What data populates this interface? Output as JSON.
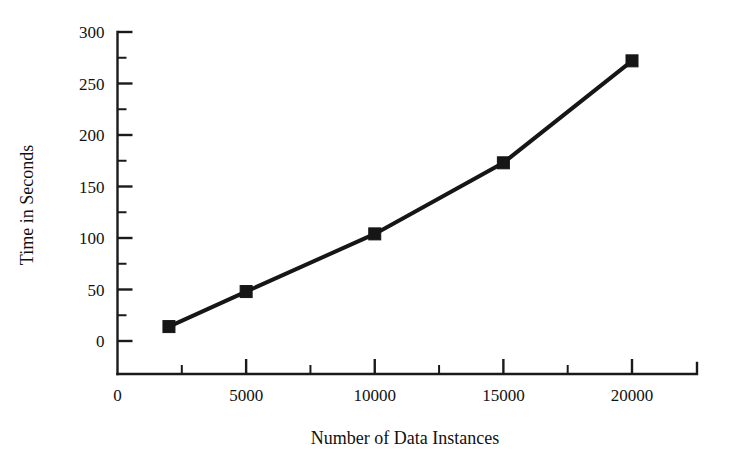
{
  "chart_data": {
    "type": "line",
    "title": "",
    "subtitle": "",
    "xlabel": "Number of Data Instances",
    "ylabel": "Time in Seconds",
    "x": [
      2000,
      5000,
      10000,
      15000,
      20000
    ],
    "values": [
      14,
      48,
      104,
      173,
      272
    ],
    "series": [
      {
        "name": "Runtime",
        "x": [
          2000,
          5000,
          10000,
          15000,
          20000
        ],
        "values": [
          14,
          48,
          104,
          173,
          272
        ]
      }
    ],
    "xlim": [
      0,
      22500
    ],
    "ylim": [
      0,
      300
    ],
    "xticks": [
      0,
      5000,
      10000,
      15000,
      20000
    ],
    "xticklabels": [
      "0",
      "5000",
      "10000",
      "15000",
      "20000"
    ],
    "xminorticks": [
      2500,
      7500,
      12500,
      17500,
      22500
    ],
    "yticks": [
      0,
      50,
      100,
      150,
      200,
      250,
      300
    ],
    "yticklabels": [
      "0",
      "50",
      "100",
      "150",
      "200",
      "250",
      "300"
    ],
    "yminorticks": [
      25,
      75,
      125,
      175,
      225,
      275
    ],
    "grid": false,
    "legend": false,
    "legend_position": "none",
    "marker": "square",
    "line_color": "#161616",
    "marker_color": "#161616",
    "background_color": "#ffffff",
    "annotations": []
  },
  "axes": {
    "x_title": "Number of Data Instances",
    "y_title": "Time in Seconds"
  }
}
